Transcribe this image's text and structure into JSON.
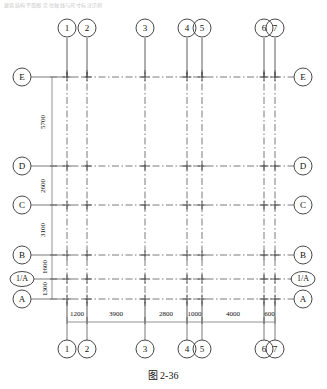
{
  "drawing": {
    "title_faint": "建筑结构平面图 定位轴线与尺寸标注示例",
    "caption": "图 2-36",
    "type": "structural-grid-plan"
  },
  "colors": {
    "line": "#4a4a4a",
    "gridline": "#6b6b6b",
    "text": "#111111",
    "background": "#ffffff",
    "faint": "#c9c9c9"
  },
  "vertical_axes": {
    "label": "Vertical grid lines (columns)",
    "items": [
      {
        "id": "1",
        "label": "1",
        "x": 67
      },
      {
        "id": "2",
        "label": "2",
        "x": 87
      },
      {
        "id": "3",
        "label": "3",
        "x": 145
      },
      {
        "id": "4",
        "label": "4",
        "x": 187
      },
      {
        "id": "5",
        "label": "5",
        "x": 202
      },
      {
        "id": "6",
        "label": "6",
        "x": 264
      },
      {
        "id": "7",
        "label": "7",
        "x": 275
      }
    ]
  },
  "horizontal_axes": {
    "label": "Horizontal grid lines (rows)",
    "items": [
      {
        "id": "E",
        "label": "E",
        "y": 77,
        "shape": "circle"
      },
      {
        "id": "D",
        "label": "D",
        "y": 166,
        "shape": "circle"
      },
      {
        "id": "C",
        "label": "C",
        "y": 205,
        "shape": "circle"
      },
      {
        "id": "B",
        "label": "B",
        "y": 255,
        "shape": "circle"
      },
      {
        "id": "1/A",
        "label": "1/A",
        "y": 279,
        "shape": "ellipse"
      },
      {
        "id": "A",
        "label": "A",
        "y": 299,
        "shape": "circle"
      }
    ]
  },
  "dimensions_bottom": {
    "label": "Horizontal dimension chain (mm)",
    "total": 13500,
    "segments": [
      {
        "value": "1200",
        "from": "1",
        "to": "2"
      },
      {
        "value": "3900",
        "from": "2",
        "to": "3"
      },
      {
        "value": "2800",
        "from": "3",
        "to": "4"
      },
      {
        "value": "1000",
        "from": "4",
        "to": "5"
      },
      {
        "value": "4000",
        "from": "5",
        "to": "6"
      },
      {
        "value": "600",
        "from": "6",
        "to": "7"
      }
    ]
  },
  "dimensions_left": {
    "label": "Vertical dimension chain (mm)",
    "total": 14300,
    "segments": [
      {
        "value": "5700",
        "from": "E",
        "to": "D"
      },
      {
        "value": "2600",
        "from": "D",
        "to": "C"
      },
      {
        "value": "3100",
        "from": "C",
        "to": "B"
      },
      {
        "value": "1600",
        "from": "B",
        "to": "1/A"
      },
      {
        "value": "1300",
        "from": "1/A",
        "to": "A"
      }
    ]
  }
}
